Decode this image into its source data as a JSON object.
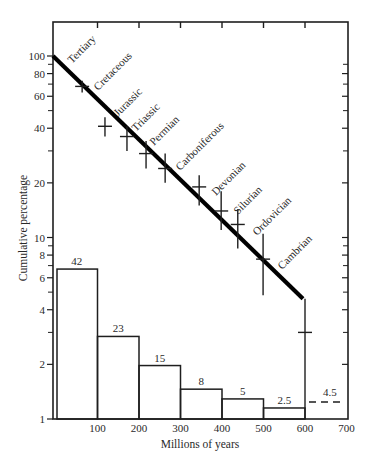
{
  "chart_data": {
    "type": "bar+line",
    "title": "",
    "xlabel": "Millions of years",
    "ylabel": "Cumulative percentage",
    "xlim": [
      0,
      700
    ],
    "ylim": [
      1,
      100
    ],
    "yscale": "log",
    "grid": false,
    "x_ticks": [
      100,
      200,
      300,
      400,
      500,
      600,
      700
    ],
    "y_ticks": [
      {
        "value": 100,
        "label": "100"
      },
      {
        "value": 80,
        "label": "80"
      },
      {
        "value": 60,
        "label": "60"
      },
      {
        "value": 40,
        "label": "40"
      },
      {
        "value": 20,
        "label": "20"
      },
      {
        "value": 10,
        "label": "10"
      },
      {
        "value": 8,
        "label": "8"
      },
      {
        "value": 6,
        "label": "6"
      },
      {
        "value": 4,
        "label": "4"
      },
      {
        "value": 2,
        "label": "2"
      },
      {
        "value": 1,
        "label": "1"
      }
    ],
    "y_minor_ticks": [
      90,
      70,
      50,
      30,
      9,
      7,
      5,
      3
    ],
    "histogram": {
      "bins": [
        {
          "x0": 0,
          "x1": 100,
          "height": 6.7,
          "label": "42"
        },
        {
          "x0": 100,
          "x1": 200,
          "height": 2.85,
          "label": "23"
        },
        {
          "x0": 200,
          "x1": 300,
          "height": 1.97,
          "label": "15"
        },
        {
          "x0": 300,
          "x1": 400,
          "height": 1.46,
          "label": "8"
        },
        {
          "x0": 400,
          "x1": 500,
          "height": 1.29,
          "label": "5"
        },
        {
          "x0": 500,
          "x1": 600,
          "height": 1.15,
          "label": "2.5"
        }
      ],
      "dashed_extension": {
        "x0": 600,
        "x1": 700,
        "height": 1.24,
        "label": "4.5"
      }
    },
    "trend_line": {
      "name": "Cumulative survivorship",
      "points": [
        [
          0,
          100
        ],
        [
          600,
          4.6
        ]
      ]
    },
    "error_bars": [
      {
        "x": 63,
        "y": 68,
        "low": 63,
        "high": 73
      },
      {
        "x": 118,
        "y": 41,
        "low": 36,
        "high": 46
      },
      {
        "x": 171,
        "y": 36,
        "low": 30,
        "high": 41
      },
      {
        "x": 217,
        "y": 29,
        "low": 24,
        "high": 34
      },
      {
        "x": 263,
        "y": 24,
        "low": 20,
        "high": 29
      },
      {
        "x": 345,
        "y": 19,
        "low": 15,
        "high": 22
      },
      {
        "x": 398,
        "y": 14,
        "low": 11,
        "high": 18
      },
      {
        "x": 438,
        "y": 11.8,
        "low": 8.7,
        "high": 14.3
      },
      {
        "x": 499,
        "y": 7.6,
        "low": 4.8,
        "high": 10.5
      },
      {
        "x": 600,
        "y": 3.0,
        "low": 1.0,
        "high": 4.6
      }
    ],
    "era_labels": [
      {
        "text": "Tertiary",
        "px": 72,
        "py": 64
      },
      {
        "text": "Cretaceous",
        "px": 98,
        "py": 91
      },
      {
        "text": "Jurassic",
        "px": 118,
        "py": 117
      },
      {
        "text": "Triassic",
        "px": 136,
        "py": 132
      },
      {
        "text": "Permian",
        "px": 154,
        "py": 146
      },
      {
        "text": "Carboniferous",
        "px": 180,
        "py": 171
      },
      {
        "text": "Devonian",
        "px": 216,
        "py": 196
      },
      {
        "text": "Silurian",
        "px": 238,
        "py": 215
      },
      {
        "text": "Ordovician",
        "px": 257,
        "py": 236
      },
      {
        "text": "Cambrian",
        "px": 282,
        "py": 270
      }
    ]
  },
  "layout": {
    "plot": {
      "left": 53,
      "right": 348,
      "top": 22,
      "bottom": 419
    },
    "x0_px": 56,
    "px_per_unit_x": 0.415,
    "y1_px": 419,
    "px_per_decade_y": 181.5
  }
}
